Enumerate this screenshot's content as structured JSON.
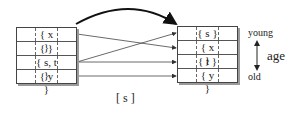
{
  "left_table": {
    "rows": [
      "{ x }",
      "{ }",
      "{ s, t }",
      "{ y }"
    ]
  },
  "right_table": {
    "rows": [
      "{ s }",
      "{ x }",
      "{ t }",
      "{ y }"
    ]
  },
  "age_axis": {
    "top_label": "young",
    "bottom_label": "old",
    "axis_label": "age"
  },
  "caption": "[ s ]",
  "connections": [
    {
      "from_row": 0,
      "to_row": 1
    },
    {
      "from_row": 2,
      "to_row": 0
    },
    {
      "from_row": 2,
      "to_row": 2
    },
    {
      "from_row": 3,
      "to_row": 3
    }
  ],
  "colors": {
    "line": "#333333",
    "shadow": "#9a9a9a"
  }
}
